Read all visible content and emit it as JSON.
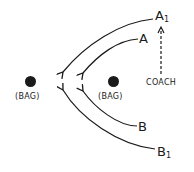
{
  "diagram": {
    "type": "baseball baserunning play diagram",
    "colors": {
      "ink": "#1a1a1a",
      "background": "#ffffff"
    },
    "bags": [
      {
        "id": "bag-left",
        "label": "(BAG)",
        "x": 30,
        "y": 81
      },
      {
        "id": "bag-right",
        "label": "(BAG)",
        "x": 113,
        "y": 81
      }
    ],
    "runners": [
      {
        "id": "A1",
        "label": "A",
        "sub": "1",
        "x": 160,
        "y": 17
      },
      {
        "id": "A",
        "label": "A",
        "sub": "",
        "x": 144,
        "y": 39
      },
      {
        "id": "B",
        "label": "B",
        "sub": "",
        "x": 142,
        "y": 127
      },
      {
        "id": "B1",
        "label": "B",
        "sub": "1",
        "x": 163,
        "y": 152
      }
    ],
    "coach": {
      "label": "COACH",
      "x": 163,
      "y": 83
    },
    "arrows": [
      {
        "from": "A1",
        "to": [
          62,
          73
        ],
        "style": "solid curved"
      },
      {
        "from": "A",
        "to": [
          82,
          74
        ],
        "style": "solid curved"
      },
      {
        "from": "B",
        "to": [
          82,
          90
        ],
        "style": "solid curved"
      },
      {
        "from": "B1",
        "to": [
          62,
          89
        ],
        "style": "solid curved"
      },
      {
        "from": "COACH",
        "to": "A1",
        "style": "dashed straight"
      }
    ]
  }
}
